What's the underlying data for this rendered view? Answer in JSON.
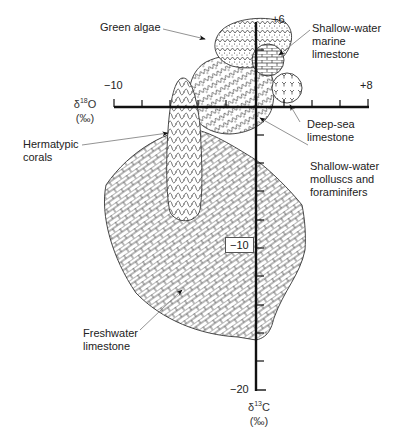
{
  "diagram": {
    "type": "isotope-crossplot",
    "x_axis": {
      "label_symbol": "δ",
      "label_sup": "18",
      "label_element": "O",
      "label_unit": "(‰)",
      "min_label": "−10",
      "max_label": "+8",
      "min": -10,
      "max": 8,
      "tick_step": 2
    },
    "y_axis": {
      "label_symbol": "δ",
      "label_sup": "13",
      "label_element": "C",
      "label_unit": "(‰)",
      "max_label": "+6",
      "mid_label": "−10",
      "min_label": "−20",
      "min": -20,
      "max": 6,
      "tick_step": 2
    },
    "fields": [
      {
        "name": "Green algae",
        "pattern": "dotted-zigzag",
        "line1": "Green algae"
      },
      {
        "name": "Shallow-water marine limestone",
        "pattern": "brick-horizontal",
        "line1": "Shallow-water",
        "line2": "marine",
        "line3": "limestone"
      },
      {
        "name": "Deep-sea limestone",
        "pattern": "trefoil",
        "line1": "Deep-sea",
        "line2": "limestone"
      },
      {
        "name": "Shallow-water molluscs and foraminifers",
        "pattern": "diagonal-zigzag",
        "line1": "Shallow-water",
        "line2": "molluscs and",
        "line3": "foraminifers"
      },
      {
        "name": "Hermatypic corals",
        "pattern": "wavy",
        "line1": "Hermatypic",
        "line2": "corals"
      },
      {
        "name": "Freshwater limestone",
        "pattern": "brick-diagonal",
        "line1": "Freshwater",
        "line2": "limestone"
      }
    ],
    "colors": {
      "ink": "#1a1a1a",
      "leader": "#777777",
      "background": "#ffffff"
    }
  }
}
